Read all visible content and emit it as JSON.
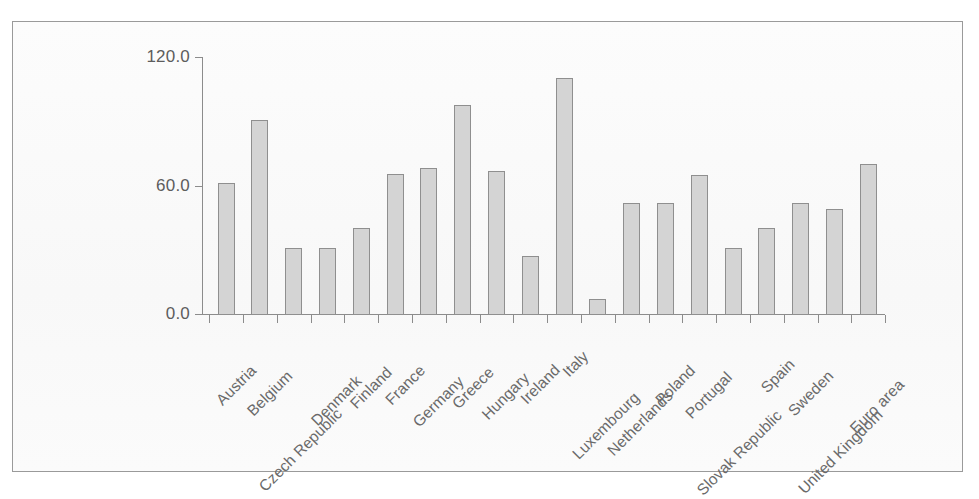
{
  "chart_data": {
    "type": "bar",
    "title": "",
    "xlabel": "",
    "ylabel": "",
    "ylim": [
      0,
      120
    ],
    "yticks": [
      "0.0",
      "60.0",
      "120.0"
    ],
    "ytick_values": [
      0,
      60,
      120
    ],
    "grid": false,
    "legend": "none",
    "bar_color": "#d4d4d4",
    "bar_edge_color": "#8f8f8f",
    "axis_color": "#8c8c8c",
    "categories": [
      "Austria",
      "Belgium",
      "Czech Republic",
      "Denmark",
      "Finland",
      "France",
      "Germany",
      "Greece",
      "Hungary",
      "Ireland",
      "Italy",
      "Luxembourg",
      "Netherlands",
      "Poland",
      "Portugal",
      "Slovak Republic",
      "Spain",
      "Sweden",
      "United Kingdom",
      "Euro area"
    ],
    "values": [
      61.0,
      90.5,
      31.0,
      31.0,
      40.0,
      65.5,
      68.0,
      97.5,
      67.0,
      27.0,
      110.0,
      7.0,
      52.0,
      52.0,
      65.0,
      31.0,
      40.0,
      52.0,
      49.0,
      70.0
    ]
  }
}
